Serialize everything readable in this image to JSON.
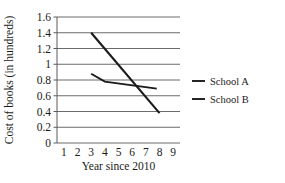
{
  "chart_data": {
    "type": "line",
    "title": "",
    "xlabel": "Year since 2010",
    "ylabel": "Cost of books (in hundreds)",
    "xlim": [
      0.5,
      9.5
    ],
    "ylim": [
      0,
      1.6
    ],
    "xticks": [
      "1",
      "2",
      "3",
      "4",
      "5",
      "6",
      "7",
      "8",
      "9"
    ],
    "yticks": [
      "0",
      "0.2",
      "0.4",
      "0.6",
      "0.8",
      "1",
      "1.2",
      "1.4",
      "1.6"
    ],
    "grid": "horizontal",
    "legend_position": "right",
    "series": [
      {
        "name": "School A",
        "color": "#1a1a1a",
        "x": [
          3,
          8
        ],
        "values": [
          1.4,
          0.38
        ]
      },
      {
        "name": "School B",
        "color": "#1a1a1a",
        "x": [
          3,
          4,
          7.8
        ],
        "values": [
          0.88,
          0.78,
          0.69
        ]
      }
    ]
  },
  "legend": {
    "items": [
      {
        "label": "School A"
      },
      {
        "label": "School B"
      }
    ]
  }
}
